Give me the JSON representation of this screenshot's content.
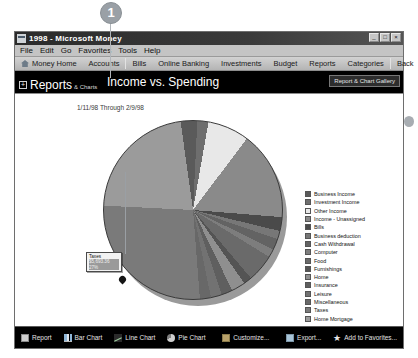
{
  "annotation": {
    "marker_1": "1"
  },
  "window": {
    "title": "1998 - Microsoft Money",
    "icon": "money-app-icon",
    "controls": {
      "minimize": "_",
      "maximize": "□",
      "close": "×"
    }
  },
  "menubar": {
    "items": [
      {
        "label": "File"
      },
      {
        "label": "Edit"
      },
      {
        "label": "Go"
      },
      {
        "label": "Favorites"
      },
      {
        "label": "Tools"
      },
      {
        "label": "Help"
      }
    ]
  },
  "navbar": {
    "items": [
      {
        "label": "Money Home",
        "icon": "home-icon"
      },
      {
        "label": "Accounts"
      },
      {
        "label": "Bills"
      },
      {
        "label": "Online Banking"
      },
      {
        "label": "Investments"
      },
      {
        "label": "Budget"
      },
      {
        "label": "Reports"
      },
      {
        "label": "Categories"
      },
      {
        "label": "Back"
      }
    ],
    "help_label": "?"
  },
  "pagehead": {
    "section": "Reports",
    "section_sub": "& Charts",
    "expand_icon": "+",
    "title": "Income vs. Spending",
    "gallery_button": "Report & Chart Gallery"
  },
  "report": {
    "date_range": "1/11/98 Through 2/9/98",
    "tooltip": {
      "category": "Taxes",
      "amount": "$5,693.36",
      "percent": "27%"
    }
  },
  "bottombar": {
    "left_items": [
      {
        "label": "Report",
        "icon": "report-icon"
      },
      {
        "label": "Bar Chart",
        "icon": "bar-chart-icon"
      },
      {
        "label": "Line Chart",
        "icon": "line-chart-icon"
      },
      {
        "label": "Pie Chart",
        "icon": "pie-chart-icon"
      }
    ],
    "mid_items": [
      {
        "label": "Customize...",
        "icon": "customize-icon"
      }
    ],
    "right_items": [
      {
        "label": "Export...",
        "icon": "export-icon"
      },
      {
        "label": "Add to Favorites...",
        "icon": "star-icon"
      }
    ]
  },
  "chart_data": {
    "type": "pie",
    "title": "Income vs. Spending",
    "subtitle": "1/11/98 Through 2/9/98",
    "legend_position": "right",
    "grid": false,
    "highlighted_slice": "Taxes",
    "categories": [
      "Business Income",
      "Investment Income",
      "Other Income",
      "Income - Unassigned",
      "Bills",
      "Business deduction",
      "Cash Withdrawal",
      "Computer",
      "Food",
      "Furnishings",
      "Home",
      "Insurance",
      "Leisure",
      "Miscellaneous",
      "Taxes",
      "Home Mortgage"
    ],
    "values": [
      3.0,
      2.0,
      7.5,
      16.0,
      2.5,
      1.5,
      2.0,
      1.5,
      5.0,
      1.5,
      2.5,
      2.0,
      2.0,
      2.0,
      27.0,
      22.0
    ],
    "colors": [
      "#5a5a5a",
      "#6e6e6e",
      "#e8e8e8",
      "#8a8a8a",
      "#4a4a4a",
      "#777777",
      "#636363",
      "#7d7d7d",
      "#6a6a6a",
      "#545454",
      "#8f8f8f",
      "#5f5f5f",
      "#727272",
      "#686868",
      "#7a7a7a",
      "#9b9b9b"
    ]
  }
}
